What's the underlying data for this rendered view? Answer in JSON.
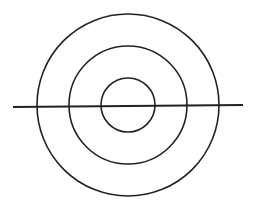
{
  "diagram": {
    "type": "concentric-circles",
    "width": 255,
    "height": 208,
    "stroke_color": "#222222",
    "background": "#ffffff",
    "center": {
      "x": 128,
      "y": 105
    },
    "circles": [
      {
        "name": "outer-circle",
        "r": 91,
        "stroke_width": 1.6
      },
      {
        "name": "middle-circle",
        "r": 59,
        "stroke_width": 1.6
      },
      {
        "name": "inner-circle",
        "r": 27,
        "stroke_width": 1.6
      }
    ],
    "line": {
      "name": "horizontal-line",
      "x1": 13,
      "y1": 107,
      "x2": 243,
      "y2": 105,
      "stroke_width": 1.8
    }
  }
}
